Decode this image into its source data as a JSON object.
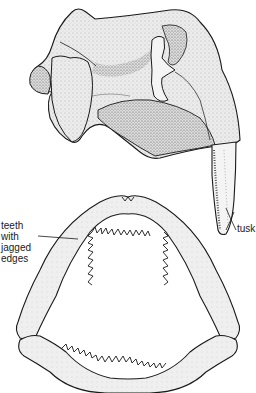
{
  "figure": {
    "labels": {
      "teeth": [
        "teeth",
        "with",
        "jagged",
        "edges"
      ],
      "tusk": "tusk"
    },
    "colors": {
      "ink": "#1a1a1a",
      "bone_fill": "#e8e8e8",
      "shade": "#9a9a9a",
      "background": "#ffffff"
    }
  }
}
